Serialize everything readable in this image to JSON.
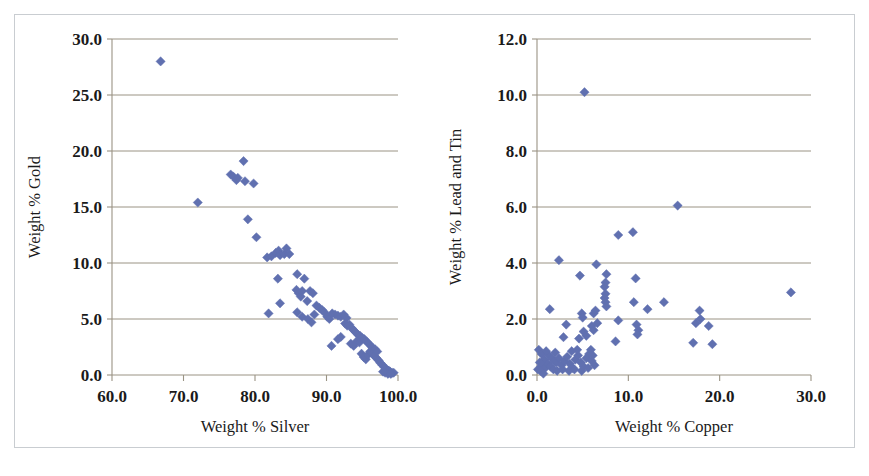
{
  "figure": {
    "background": "#ffffff",
    "frame_color": "#c9cdd1",
    "marker_color": "#6070b0",
    "gridline_color": "#9a9384"
  },
  "chart_data": [
    {
      "type": "scatter",
      "id": "gold-vs-silver",
      "title": "",
      "xlabel": "Weight % Silver",
      "ylabel": "Weight % Gold",
      "xlim": [
        60.0,
        100.0
      ],
      "ylim": [
        0.0,
        30.0
      ],
      "xticks": [
        60.0,
        70.0,
        80.0,
        90.0,
        100.0
      ],
      "yticks": [
        0.0,
        5.0,
        10.0,
        15.0,
        20.0,
        25.0,
        30.0
      ],
      "xtick_labels": [
        "60.0",
        "70.0",
        "80.0",
        "90.0",
        "100.0"
      ],
      "ytick_labels": [
        "0.0",
        "5.0",
        "10.0",
        "15.0",
        "20.0",
        "25.0",
        "30.0"
      ],
      "grid": "horizontal",
      "legend": "none",
      "marker": "diamond",
      "marker_color": "#6070b0",
      "points": [
        [
          66.8,
          28.0
        ],
        [
          72.0,
          15.4
        ],
        [
          76.6,
          17.9
        ],
        [
          77.0,
          17.7
        ],
        [
          77.4,
          17.4
        ],
        [
          77.6,
          17.6
        ],
        [
          78.4,
          19.1
        ],
        [
          78.6,
          17.3
        ],
        [
          79.8,
          17.1
        ],
        [
          79.0,
          13.9
        ],
        [
          80.2,
          12.3
        ],
        [
          81.7,
          10.5
        ],
        [
          82.3,
          10.6
        ],
        [
          82.9,
          10.9
        ],
        [
          83.3,
          11.1
        ],
        [
          83.5,
          10.7
        ],
        [
          84.1,
          10.8
        ],
        [
          84.4,
          11.3
        ],
        [
          84.8,
          10.8
        ],
        [
          83.2,
          8.6
        ],
        [
          85.9,
          9.0
        ],
        [
          86.9,
          8.6
        ],
        [
          81.9,
          5.5
        ],
        [
          83.5,
          6.4
        ],
        [
          85.8,
          7.6
        ],
        [
          86.1,
          7.3
        ],
        [
          86.4,
          7.0
        ],
        [
          86.6,
          7.5
        ],
        [
          87.3,
          6.6
        ],
        [
          87.7,
          7.5
        ],
        [
          88.1,
          7.3
        ],
        [
          85.9,
          5.6
        ],
        [
          86.6,
          5.2
        ],
        [
          87.4,
          5.0
        ],
        [
          87.9,
          4.7
        ],
        [
          88.3,
          5.4
        ],
        [
          88.6,
          6.2
        ],
        [
          89.0,
          6.0
        ],
        [
          89.4,
          5.8
        ],
        [
          89.7,
          5.6
        ],
        [
          90.1,
          5.2
        ],
        [
          90.4,
          5.0
        ],
        [
          90.8,
          5.5
        ],
        [
          91.2,
          5.4
        ],
        [
          91.6,
          5.3
        ],
        [
          92.0,
          5.2
        ],
        [
          92.4,
          5.4
        ],
        [
          92.8,
          5.1
        ],
        [
          90.7,
          2.6
        ],
        [
          91.6,
          3.2
        ],
        [
          92.0,
          3.4
        ],
        [
          92.6,
          4.6
        ],
        [
          92.9,
          4.4
        ],
        [
          93.2,
          4.5
        ],
        [
          93.5,
          4.2
        ],
        [
          93.8,
          4.0
        ],
        [
          94.1,
          3.8
        ],
        [
          94.4,
          3.6
        ],
        [
          94.7,
          3.5
        ],
        [
          95.0,
          3.3
        ],
        [
          93.4,
          2.8
        ],
        [
          93.8,
          2.6
        ],
        [
          94.2,
          3.0
        ],
        [
          94.6,
          2.9
        ],
        [
          95.3,
          3.2
        ],
        [
          95.6,
          3.0
        ],
        [
          95.9,
          2.8
        ],
        [
          96.2,
          2.6
        ],
        [
          96.5,
          2.4
        ],
        [
          94.9,
          1.9
        ],
        [
          95.2,
          1.6
        ],
        [
          95.5,
          1.4
        ],
        [
          95.8,
          1.8
        ],
        [
          96.1,
          2.1
        ],
        [
          96.4,
          1.9
        ],
        [
          96.7,
          1.7
        ],
        [
          97.0,
          1.5
        ],
        [
          97.3,
          1.3
        ],
        [
          96.8,
          2.3
        ],
        [
          97.1,
          2.1
        ],
        [
          97.5,
          1.1
        ],
        [
          97.8,
          0.9
        ],
        [
          98.1,
          0.7
        ],
        [
          98.4,
          0.5
        ],
        [
          98.7,
          0.4
        ],
        [
          98.9,
          0.3
        ],
        [
          99.2,
          0.2
        ],
        [
          99.4,
          0.2
        ],
        [
          98.2,
          0.2
        ],
        [
          98.6,
          0.1
        ],
        [
          97.9,
          0.3
        ],
        [
          99.0,
          0.1
        ]
      ]
    },
    {
      "type": "scatter",
      "id": "leadtin-vs-copper",
      "title": "",
      "xlabel": "Weight % Copper",
      "ylabel": "Weight % Lead and Tin",
      "xlim": [
        0.0,
        30.0
      ],
      "ylim": [
        0.0,
        12.0
      ],
      "xticks": [
        0.0,
        10.0,
        20.0,
        30.0
      ],
      "yticks": [
        0.0,
        2.0,
        4.0,
        6.0,
        8.0,
        10.0,
        12.0
      ],
      "xtick_labels": [
        "0.0",
        "10.0",
        "20.0",
        "30.0"
      ],
      "ytick_labels": [
        "0.0",
        "2.0",
        "4.0",
        "6.0",
        "8.0",
        "10.0",
        "12.0"
      ],
      "grid": "horizontal",
      "legend": "none",
      "marker": "diamond",
      "marker_color": "#6070b0",
      "points": [
        [
          5.2,
          10.1
        ],
        [
          15.4,
          6.05
        ],
        [
          8.9,
          5.0
        ],
        [
          10.5,
          5.1
        ],
        [
          2.4,
          4.1
        ],
        [
          6.5,
          3.95
        ],
        [
          4.7,
          3.55
        ],
        [
          7.6,
          3.6
        ],
        [
          7.5,
          3.3
        ],
        [
          7.4,
          3.15
        ],
        [
          10.8,
          3.45
        ],
        [
          27.8,
          2.95
        ],
        [
          7.5,
          2.9
        ],
        [
          7.4,
          2.75
        ],
        [
          7.5,
          2.6
        ],
        [
          7.6,
          2.45
        ],
        [
          10.6,
          2.6
        ],
        [
          13.9,
          2.6
        ],
        [
          12.1,
          2.35
        ],
        [
          17.8,
          2.3
        ],
        [
          1.4,
          2.35
        ],
        [
          4.9,
          2.2
        ],
        [
          5.0,
          2.05
        ],
        [
          6.2,
          2.2
        ],
        [
          6.4,
          2.3
        ],
        [
          8.9,
          1.95
        ],
        [
          10.9,
          1.8
        ],
        [
          11.1,
          1.6
        ],
        [
          11.0,
          1.45
        ],
        [
          17.4,
          1.85
        ],
        [
          18.8,
          1.75
        ],
        [
          17.9,
          2.0
        ],
        [
          3.2,
          1.8
        ],
        [
          5.1,
          1.55
        ],
        [
          5.4,
          1.4
        ],
        [
          6.0,
          1.75
        ],
        [
          6.2,
          1.6
        ],
        [
          6.6,
          1.85
        ],
        [
          2.9,
          1.35
        ],
        [
          4.6,
          1.3
        ],
        [
          8.6,
          1.2
        ],
        [
          17.1,
          1.15
        ],
        [
          19.2,
          1.1
        ],
        [
          0.2,
          0.9
        ],
        [
          0.5,
          0.75
        ],
        [
          0.8,
          0.55
        ],
        [
          0.3,
          0.45
        ],
        [
          0.6,
          0.35
        ],
        [
          0.9,
          0.25
        ],
        [
          0.4,
          0.15
        ],
        [
          0.7,
          0.05
        ],
        [
          1.3,
          0.7
        ],
        [
          1.6,
          0.6
        ],
        [
          1.9,
          0.5
        ],
        [
          1.2,
          0.4
        ],
        [
          1.5,
          0.3
        ],
        [
          1.8,
          0.2
        ],
        [
          2.1,
          0.45
        ],
        [
          2.4,
          0.6
        ],
        [
          2.7,
          0.35
        ],
        [
          3.0,
          0.5
        ],
        [
          3.3,
          0.65
        ],
        [
          3.6,
          0.4
        ],
        [
          3.9,
          0.25
        ],
        [
          4.2,
          0.55
        ],
        [
          4.5,
          0.7
        ],
        [
          4.8,
          0.45
        ],
        [
          5.1,
          0.3
        ],
        [
          5.4,
          0.6
        ],
        [
          5.7,
          0.75
        ],
        [
          6.0,
          0.5
        ],
        [
          6.3,
          0.35
        ],
        [
          2.2,
          0.15
        ],
        [
          2.8,
          0.2
        ],
        [
          3.5,
          0.15
        ],
        [
          4.1,
          0.2
        ],
        [
          4.9,
          0.15
        ],
        [
          5.6,
          0.25
        ],
        [
          0.1,
          0.2
        ],
        [
          1.0,
          0.85
        ],
        [
          2.0,
          0.8
        ],
        [
          3.8,
          0.85
        ],
        [
          4.4,
          0.9
        ],
        [
          5.9,
          0.9
        ],
        [
          6.1,
          0.7
        ]
      ]
    }
  ]
}
